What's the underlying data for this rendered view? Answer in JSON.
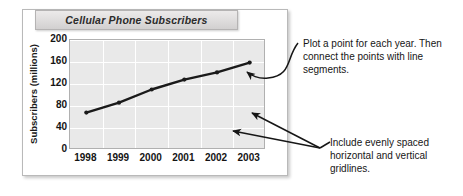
{
  "figure": {
    "title": "Cellular Phone Subscribers"
  },
  "chart_data": {
    "type": "line",
    "title": "Cellular Phone Subscribers",
    "xlabel": "",
    "ylabel": "Subscribers (millions)",
    "categories": [
      "1998",
      "1999",
      "2000",
      "2001",
      "2002",
      "2003"
    ],
    "values": [
      68,
      86,
      110,
      128,
      141,
      159
    ],
    "series": [
      {
        "name": "Subscribers",
        "values": [
          68,
          86,
          110,
          128,
          141,
          159
        ]
      }
    ],
    "y_ticks": [
      0,
      40,
      80,
      120,
      160,
      200
    ],
    "x_ticks": [
      "1998",
      "1999",
      "2000",
      "2001",
      "2002",
      "2003"
    ],
    "ylim": [
      0,
      200
    ],
    "grid": "both",
    "legend": "none",
    "marker": "circle",
    "line_color": "#1a1a1a",
    "plot_bg_color": "#e9e9e9",
    "gridline_color": "#ffffff"
  },
  "annotations": {
    "top": "Plot a point for each year. Then connect the points with line segments.",
    "bottom": "Include evenly spaced horizontal and vertical gridlines."
  },
  "colors": {
    "frame_border": "#b9b9b9",
    "title_bar_bg": "#ddd9d9",
    "text": "#161616"
  }
}
